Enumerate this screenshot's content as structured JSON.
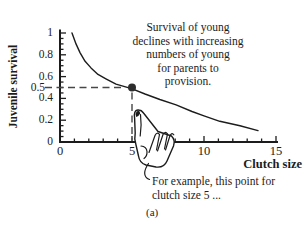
{
  "figure": {
    "caption": "(a)",
    "annotation_lines": [
      "Survival of young",
      "declines with increasing",
      "numbers of young",
      "for parents to",
      "provision."
    ],
    "note_lines": [
      "For example, this point  for",
      "clutch size 5 ..."
    ]
  },
  "chart_data": {
    "type": "line",
    "title": "",
    "xlabel": "Clutch size",
    "ylabel": "Juvenile survival",
    "xlim": [
      0,
      15
    ],
    "ylim": [
      0,
      1
    ],
    "grid": false,
    "legend": false,
    "x_axis": {
      "minor_step": 1,
      "major_ticks": [
        0,
        5,
        10,
        15
      ],
      "tick_labels": [
        "0",
        "5",
        "10",
        "15"
      ]
    },
    "y_axis": {
      "minor_step": 0.05,
      "major_ticks": [
        0,
        0.2,
        0.4,
        0.6,
        0.8,
        1
      ],
      "labeled_ticks": [
        {
          "v": 1,
          "label": "1"
        },
        {
          "v": 0.8,
          "label": "0.8"
        },
        {
          "v": 0.6,
          "label": "0.6"
        },
        {
          "v": 0.5,
          "label": "0.5",
          "highlight": true
        },
        {
          "v": 0.4,
          "label": "0.4"
        },
        {
          "v": 0.2,
          "label": "0.2"
        },
        {
          "v": 0,
          "label": "0"
        }
      ]
    },
    "series": [
      {
        "name": "juvenile-survival-vs-clutch-size",
        "points": [
          [
            0.83,
            1.0
          ],
          [
            1.11,
            0.9
          ],
          [
            1.39,
            0.82
          ],
          [
            1.74,
            0.74
          ],
          [
            2.15,
            0.68
          ],
          [
            2.64,
            0.62
          ],
          [
            3.19,
            0.58
          ],
          [
            3.89,
            0.53
          ],
          [
            4.97,
            0.49
          ],
          [
            5.9,
            0.44
          ],
          [
            6.94,
            0.39
          ],
          [
            8.06,
            0.34
          ],
          [
            9.17,
            0.28
          ],
          [
            10.0,
            0.24
          ],
          [
            11.1,
            0.19
          ],
          [
            12.5,
            0.15
          ],
          [
            13.75,
            0.105
          ]
        ]
      }
    ],
    "highlight_point": {
      "x": 5,
      "y": 0.5
    }
  },
  "colors": {
    "ink": "#1c1c1c",
    "dash": "#474747",
    "dot": "#2d2d2d",
    "background": "#ffffff"
  }
}
